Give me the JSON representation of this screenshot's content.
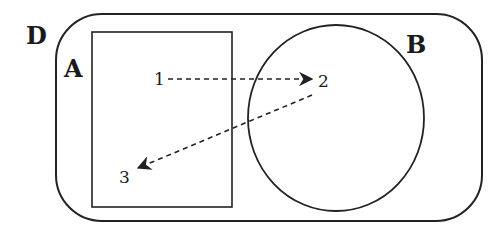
{
  "diagram": {
    "sets": [
      {
        "id": "D",
        "label": "D",
        "shape": "rounded-rectangle",
        "role": "outer set"
      },
      {
        "id": "A",
        "label": "A",
        "shape": "rectangle",
        "role": "subset inside D"
      },
      {
        "id": "B",
        "label": "B",
        "shape": "circle",
        "role": "subset inside D"
      }
    ],
    "points": [
      {
        "id": "1",
        "label": "1",
        "in": "A"
      },
      {
        "id": "2",
        "label": "2",
        "in": "B"
      },
      {
        "id": "3",
        "label": "3",
        "in": "A"
      }
    ],
    "arrows": [
      {
        "from": "1",
        "to": "2",
        "style": "dashed"
      },
      {
        "from": "2",
        "to": "3",
        "style": "dashed"
      }
    ],
    "colors": {
      "stroke": "#222222",
      "background": "#ffffff"
    }
  }
}
